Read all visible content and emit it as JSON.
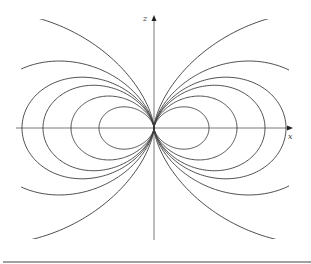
{
  "figure": {
    "type": "dipole-field-lines",
    "axes": {
      "x_label": "x",
      "z_label": "z"
    },
    "field_lines": {
      "equation": "r = k sin^2(theta)",
      "k_values_px": [
        55,
        83,
        111,
        132,
        174,
        303
      ],
      "closed_loops": 4,
      "open_curves": 2
    },
    "colors": {
      "line": "#3a3a3a",
      "axis": "#555555",
      "rule": "#444444"
    }
  }
}
